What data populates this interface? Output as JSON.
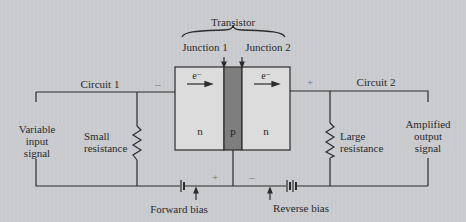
{
  "title": "Transistor",
  "junctions": {
    "j1": "Junction 1",
    "j2": "Junction 2"
  },
  "circuits": {
    "c1": "Circuit 1",
    "c2": "Circuit 2"
  },
  "regions": {
    "left": "n",
    "middle": "p",
    "right": "n"
  },
  "electron_labels": {
    "left": "e⁻",
    "right": "e⁻"
  },
  "signals": {
    "input": "Variable\ninput\nsignal",
    "output": "Amplified\noutput\nsignal"
  },
  "resistors": {
    "small": "Small\nresistance",
    "large": "Large\nresistance"
  },
  "bias": {
    "forward": "Forward bias",
    "reverse": "Reverse bias"
  },
  "polarity": {
    "top_left": "–",
    "top_right": "+",
    "bottom_left": "+",
    "bottom_right": "–"
  },
  "colors": {
    "background": "#c9cbcf",
    "n_region": "#dcdcdc",
    "p_region": "#7e7e7e",
    "wire": "#2b2b2b"
  }
}
